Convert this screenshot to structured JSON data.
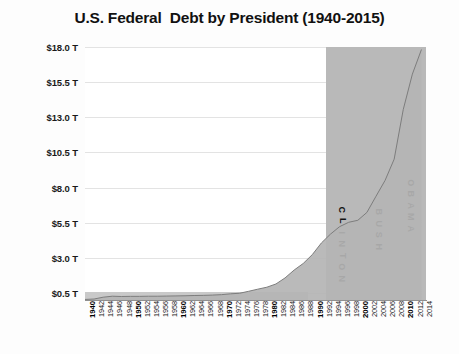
{
  "chart_data": {
    "type": "area",
    "title": "U.S. Federal  Debt by President (1940-2015)",
    "xlabel": "",
    "ylabel": "",
    "ylim": [
      0,
      18.0
    ],
    "xlim": [
      1940,
      2015
    ],
    "grid": true,
    "legend": "none",
    "units": "Trillions of USD",
    "ytick_labels": [
      "$18.0 T",
      "$15.5 T",
      "$13.0 T",
      "$10.5 T",
      "$8.0 T",
      "$5.5 T",
      "$3.0 T",
      "$0.5 T"
    ],
    "ytick_values": [
      18.0,
      15.5,
      13.0,
      10.5,
      8.0,
      5.5,
      3.0,
      0.5
    ],
    "xtick_labels": [
      "1940",
      "1942",
      "1944",
      "1946",
      "1948",
      "1950",
      "1952",
      "1954",
      "1956",
      "1958",
      "1960",
      "1962",
      "1964",
      "1966",
      "1968",
      "1970",
      "1972",
      "1974",
      "1976",
      "1978",
      "1980",
      "1982",
      "1984",
      "1986",
      "1988",
      "1990",
      "1992",
      "1994",
      "1996",
      "1998",
      "2000",
      "2002",
      "2004",
      "2006",
      "2008",
      "2010",
      "2012",
      "2014"
    ],
    "decade_ticks": [
      "1940",
      "1950",
      "1960",
      "1970",
      "1980",
      "1990",
      "2000",
      "2010"
    ],
    "x": [
      1940,
      1942,
      1944,
      1946,
      1948,
      1950,
      1952,
      1954,
      1956,
      1958,
      1960,
      1962,
      1964,
      1966,
      1968,
      1970,
      1972,
      1974,
      1976,
      1978,
      1980,
      1982,
      1984,
      1986,
      1988,
      1990,
      1992,
      1994,
      1996,
      1998,
      2000,
      2002,
      2004,
      2006,
      2008,
      2010,
      2012,
      2014
    ],
    "values": [
      0.04,
      0.07,
      0.2,
      0.27,
      0.25,
      0.26,
      0.26,
      0.27,
      0.27,
      0.28,
      0.29,
      0.3,
      0.32,
      0.33,
      0.35,
      0.38,
      0.44,
      0.48,
      0.62,
      0.77,
      0.91,
      1.14,
      1.57,
      2.13,
      2.6,
      3.23,
      4.06,
      4.69,
      5.22,
      5.53,
      5.67,
      6.23,
      7.38,
      8.51,
      10.02,
      13.56,
      16.07,
      17.82
    ],
    "presidents": [
      {
        "name": "ROOSEVELT",
        "start": 1940,
        "end": 1945,
        "label_shown": false
      },
      {
        "name": "TRUMAN",
        "start": 1945,
        "end": 1953,
        "label_shown": false
      },
      {
        "name": "EISENHOWER",
        "start": 1953,
        "end": 1961,
        "label_shown": false
      },
      {
        "name": "KENNEDY",
        "start": 1961,
        "end": 1963,
        "label_shown": false
      },
      {
        "name": "JOHNSON",
        "start": 1963,
        "end": 1969,
        "label_shown": false
      },
      {
        "name": "NIXON",
        "start": 1969,
        "end": 1974,
        "label_shown": false
      },
      {
        "name": "FORD",
        "start": 1974,
        "end": 1977,
        "label_shown": false
      },
      {
        "name": "CARTER",
        "start": 1977,
        "end": 1981,
        "label_shown": false
      },
      {
        "name": "REAGAN",
        "start": 1981,
        "end": 1989,
        "label_shown": false
      },
      {
        "name": "CLINTON",
        "start": 1993,
        "end": 2001,
        "label_shown": true
      },
      {
        "name": "BUSH",
        "start": 2001,
        "end": 2009,
        "label_shown": true
      },
      {
        "name": "OBAMA",
        "start": 2009,
        "end": 2015,
        "label_shown": true
      }
    ],
    "series_fill_color": "#b4b4b4",
    "band_color": "#b9b9b9",
    "grid_color": "#e3e3e3",
    "text_color": "#111111"
  }
}
